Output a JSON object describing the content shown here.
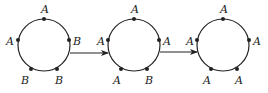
{
  "diagram": {
    "type": "state-transition",
    "stroke_color": "#222222",
    "states": [
      {
        "name": "state-1",
        "cx": 44,
        "cy": 45,
        "r": 26,
        "nodes": [
          {
            "pos": "top",
            "label": "A",
            "x": 44,
            "y": 19,
            "lx": 41,
            "ly": 13
          },
          {
            "pos": "right",
            "label": "B",
            "x": 69,
            "y": 40,
            "lx": 73,
            "ly": 45
          },
          {
            "pos": "bottom-right",
            "label": "B",
            "x": 57,
            "y": 69,
            "lx": 55,
            "ly": 84
          },
          {
            "pos": "bottom-left",
            "label": "B",
            "x": 31,
            "y": 69,
            "lx": 21,
            "ly": 84
          },
          {
            "pos": "left",
            "label": "A",
            "x": 18,
            "y": 40,
            "lx": 6,
            "ly": 45
          }
        ]
      },
      {
        "name": "state-2",
        "cx": 134,
        "cy": 45,
        "r": 26,
        "nodes": [
          {
            "pos": "top",
            "label": "A",
            "x": 134,
            "y": 19,
            "lx": 131,
            "ly": 13
          },
          {
            "pos": "right",
            "label": "A",
            "x": 159,
            "y": 40,
            "lx": 163,
            "ly": 45
          },
          {
            "pos": "bottom-right",
            "label": "B",
            "x": 147,
            "y": 69,
            "lx": 145,
            "ly": 84
          },
          {
            "pos": "bottom-left",
            "label": "A",
            "x": 121,
            "y": 69,
            "lx": 113,
            "ly": 84
          },
          {
            "pos": "left",
            "label": "A",
            "x": 108,
            "y": 40,
            "lx": 97,
            "ly": 45
          }
        ]
      },
      {
        "name": "state-3",
        "cx": 223,
        "cy": 45,
        "r": 26,
        "nodes": [
          {
            "pos": "top",
            "label": "A",
            "x": 223,
            "y": 19,
            "lx": 220,
            "ly": 13
          },
          {
            "pos": "right",
            "label": "A",
            "x": 249,
            "y": 40,
            "lx": 253,
            "ly": 45
          },
          {
            "pos": "bottom-right",
            "label": "A",
            "x": 237,
            "y": 69,
            "lx": 235,
            "ly": 84
          },
          {
            "pos": "bottom-left",
            "label": "A",
            "x": 211,
            "y": 69,
            "lx": 203,
            "ly": 84
          },
          {
            "pos": "left",
            "label": "A",
            "x": 197,
            "y": 40,
            "lx": 186,
            "ly": 45
          }
        ]
      }
    ],
    "arrows": [
      {
        "from": "state-1",
        "to": "state-2",
        "x1": 70,
        "y1": 53,
        "x2": 108,
        "y2": 53
      },
      {
        "from": "state-2",
        "to": "state-3",
        "x1": 160,
        "y1": 52,
        "x2": 197,
        "y2": 52
      }
    ]
  }
}
